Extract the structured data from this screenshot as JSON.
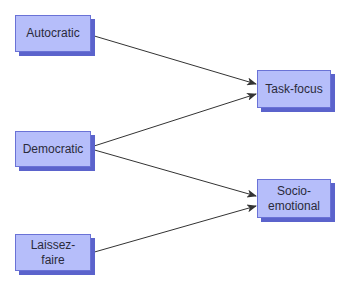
{
  "diagram": {
    "type": "flow",
    "colors": {
      "node_fill": "#b6befa",
      "node_border": "#6a72d6",
      "node_shadow": "#5b63cc",
      "arrow": "#333333",
      "text": "#2a2a3a"
    },
    "nodes": {
      "autocratic": {
        "label": "Autocratic"
      },
      "democratic": {
        "label": "Democratic"
      },
      "laissez_faire": {
        "line1": "Laissez-",
        "line2": "faire"
      },
      "task_focus": {
        "label": "Task-focus"
      },
      "socio_emotional": {
        "line1": "Socio-",
        "line2": "emotional"
      }
    },
    "edges": [
      {
        "from": "Autocratic",
        "to": "Task-focus"
      },
      {
        "from": "Democratic",
        "to": "Task-focus"
      },
      {
        "from": "Democratic",
        "to": "Socio-emotional"
      },
      {
        "from": "Laissez-faire",
        "to": "Socio-emotional"
      }
    ]
  }
}
